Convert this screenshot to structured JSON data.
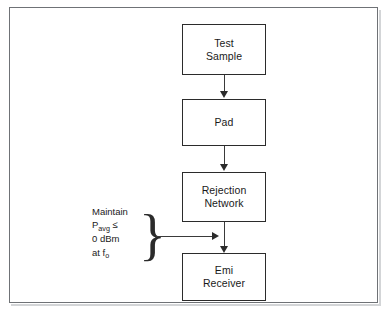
{
  "figure": {
    "background_color": "#ffffff",
    "frame_color": "#6f7276",
    "line_color": "#2b2b2b",
    "text_color": "#1a1a1a"
  },
  "nodes": [
    {
      "id": "test-sample",
      "line1": "Test",
      "line2": "Sample"
    },
    {
      "id": "pad",
      "line1": "Pad",
      "line2": ""
    },
    {
      "id": "rejection-network",
      "line1": "Rejection",
      "line2": "Network"
    },
    {
      "id": "emi-receiver",
      "line1": "Emi",
      "line2": "Receiver"
    }
  ],
  "annotation": {
    "line1": "Maintain",
    "line2_symbol": "P",
    "line2_subscript": "avg",
    "line2_operator": "≤",
    "line3": "0 dBm",
    "line4_prefix": "at",
    "line4_symbol": "f",
    "line4_subscript": "o",
    "brace_glyph": "}"
  }
}
